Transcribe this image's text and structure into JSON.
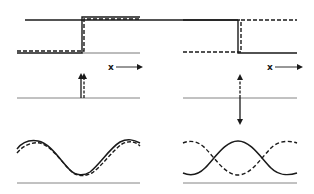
{
  "figure": {
    "panels": [
      {
        "id": "left",
        "step": {
          "solid": {
            "low_y": 53,
            "high_y": 17,
            "step_x": 82,
            "x_start": 17,
            "x_end": 140
          },
          "dashed": {
            "low_y": 53,
            "high_y": 17,
            "step_x": 82,
            "x_start": 17,
            "x_end": 140
          }
        },
        "axis_label": "x",
        "impulse": {
          "direction_solid": "up",
          "direction_dashed": "up"
        },
        "wave": {
          "phase_shift": "small",
          "relation": "nearly in phase"
        }
      },
      {
        "id": "right",
        "step": {
          "solid": {
            "description": "high then low"
          },
          "dashed": {
            "description": "low then high"
          }
        },
        "axis_label": "x",
        "impulse": {
          "direction_solid": "down",
          "direction_dashed": "up"
        },
        "wave": {
          "phase_shift": "180 degrees",
          "relation": "out of phase"
        }
      }
    ],
    "colors": {
      "ink": "#1a1a1a",
      "baseline": "#777777",
      "background": "#ffffff"
    }
  },
  "labels": {
    "left_x": "x",
    "right_x": "x"
  }
}
